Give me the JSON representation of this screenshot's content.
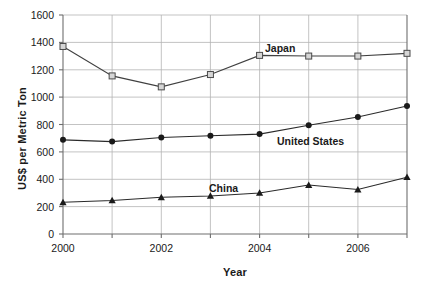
{
  "chart_data": {
    "type": "line",
    "title": "",
    "xlabel": "Year",
    "ylabel": "US$ per Metric Ton",
    "x": [
      2000,
      2001,
      2002,
      2003,
      2004,
      2005,
      2006,
      2007
    ],
    "xlim": [
      2000,
      2007
    ],
    "ylim": [
      0,
      1600
    ],
    "xticks": [
      2000,
      2001,
      2002,
      2003,
      2004,
      2005,
      2006,
      2007
    ],
    "xtick_labels": [
      "2000",
      "",
      "2002",
      "",
      "2004",
      "",
      "2006",
      ""
    ],
    "yticks": [
      0,
      200,
      400,
      600,
      800,
      1000,
      1200,
      1400,
      1600
    ],
    "ytick_labels": [
      "0",
      "200",
      "400",
      "600",
      "800",
      "1000",
      "1200",
      "1400",
      "1600"
    ],
    "grid": "horizontal-and-vertical",
    "legend": "inline-labels",
    "series": [
      {
        "name": "Japan",
        "marker": "open-square",
        "color": "#333333",
        "values": [
          1370,
          1155,
          1075,
          1165,
          1305,
          1300,
          1300,
          1320
        ]
      },
      {
        "name": "United States",
        "marker": "filled-circle",
        "color": "#1a1a1a",
        "values": [
          688,
          675,
          705,
          718,
          730,
          795,
          855,
          935
        ]
      },
      {
        "name": "China",
        "marker": "filled-triangle",
        "color": "#1a1a1a",
        "values": [
          232,
          245,
          268,
          278,
          300,
          358,
          325,
          415
        ]
      }
    ],
    "annotations": [
      {
        "text": "Japan",
        "x": 2004,
        "y": 1400
      },
      {
        "text": "United States",
        "x": 2004.6,
        "y": 700
      },
      {
        "text": "China",
        "x": 2003.1,
        "y": 400
      }
    ]
  },
  "axis": {
    "x_title": "Year",
    "y_title": "US$ per Metric Ton"
  },
  "ticks": {
    "y": [
      "1600",
      "1400",
      "1200",
      "1000",
      "800",
      "600",
      "400",
      "200",
      "0"
    ],
    "x": [
      "2000",
      "2002",
      "2004",
      "2006"
    ]
  },
  "labels": {
    "japan": "Japan",
    "united_states": "United States",
    "china": "China"
  },
  "colors": {
    "axis": "#808080",
    "grid": "#b0b0b0",
    "series_line": "#404040",
    "text": "#1a1a1a"
  }
}
